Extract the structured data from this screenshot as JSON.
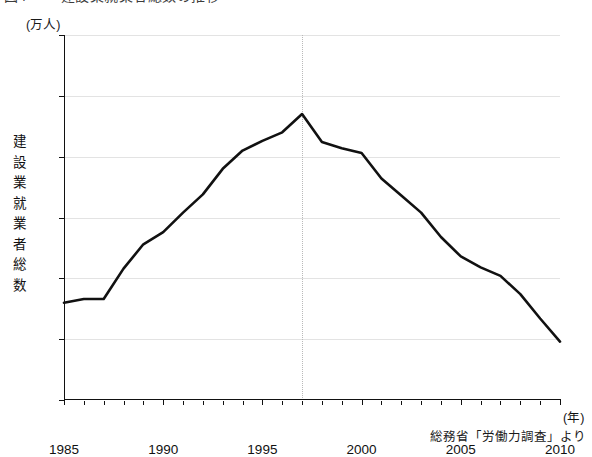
{
  "title": {
    "text": "建設業就業者総数の推移",
    "number": "図4"
  },
  "unit_label": "(万人)",
  "y_axis": {
    "title_chars": [
      "建",
      "設",
      "業",
      "就",
      "業",
      "者",
      "総",
      "数"
    ],
    "title": "建設業就業者総数",
    "ticks": [
      750,
      700,
      650,
      600,
      550,
      500,
      450
    ],
    "min": 450,
    "max": 750
  },
  "x_axis": {
    "unit": "(年)",
    "ticks": [
      1985,
      1990,
      1995,
      2000,
      2005,
      2010
    ],
    "min": 1985,
    "max": 2010
  },
  "source_note": "総務省「労働力調査」より",
  "style": {
    "line_color": "#111111",
    "grid_color": "#e3e3e3",
    "marker_line_color": "#b9b9b9",
    "axis_color": "#111111",
    "background": "#ffffff"
  },
  "chart_data": {
    "type": "line",
    "title": "建設業就業者総数の推移",
    "xlabel": "(年)",
    "ylabel": "建設業就業者総数（万人）",
    "xlim": [
      1985,
      2010
    ],
    "ylim": [
      450,
      750
    ],
    "ytick_step": 50,
    "grid": "horizontal",
    "legend": "none",
    "annotations": [
      {
        "type": "vertical-marker",
        "x": 1997,
        "label": "peak",
        "style": "dotted"
      }
    ],
    "x": [
      1985,
      1986,
      1987,
      1988,
      1989,
      1990,
      1991,
      1992,
      1993,
      1994,
      1995,
      1996,
      1997,
      1998,
      1999,
      2000,
      2001,
      2002,
      2003,
      2004,
      2005,
      2006,
      2007,
      2008,
      2009,
      2010
    ],
    "values": [
      530,
      533,
      533,
      558,
      578,
      588,
      604,
      619,
      640,
      655,
      663,
      670,
      685,
      662,
      657,
      653,
      632,
      618,
      604,
      584,
      568,
      559,
      552,
      537,
      517,
      498
    ],
    "series": [
      {
        "name": "建設業就業者総数",
        "values": [
          530,
          533,
          533,
          558,
          578,
          588,
          604,
          619,
          640,
          655,
          663,
          670,
          685,
          662,
          657,
          653,
          632,
          618,
          604,
          584,
          568,
          559,
          552,
          537,
          517,
          498
        ]
      }
    ]
  }
}
